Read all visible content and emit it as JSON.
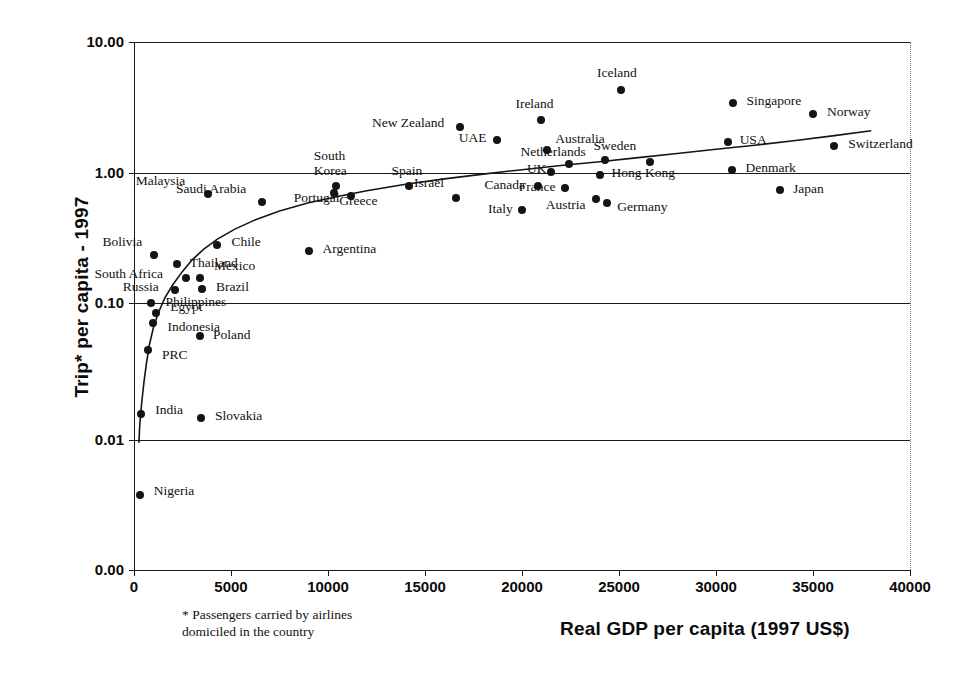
{
  "chart_data": {
    "type": "scatter",
    "title": "",
    "xlabel": "Real GDP per capita (1997 US$)",
    "ylabel": "Trip* per capita - 1997",
    "footnote": "* Passengers carried by airlines\ndomiciled in the country",
    "footnote_line1": "* Passengers carried by airlines",
    "footnote_line2": "domiciled in the country",
    "xlim": [
      0,
      40000
    ],
    "ylim": [
      0.001,
      10.0
    ],
    "yscale": "log",
    "xscale": "linear",
    "grid": true,
    "legend": "none",
    "xticks": [
      "0",
      "5000",
      "10000",
      "15000",
      "20000",
      "25000",
      "30000",
      "35000",
      "40000"
    ],
    "xtick_values": [
      0,
      5000,
      10000,
      15000,
      20000,
      25000,
      30000,
      35000,
      40000
    ],
    "yticks": [
      "10.00",
      "1.00",
      "0.10",
      "0.01",
      "0.00"
    ],
    "ytick_values": [
      10.0,
      1.0,
      0.1,
      0.01,
      0.001
    ],
    "marker_color": "#141414",
    "line_color": "#141414",
    "has_fitted_curve": true,
    "points": [
      {
        "name": "Nigeria",
        "x": 300,
        "y": 0.0038,
        "lx": 14,
        "ly": -4
      },
      {
        "name": "India",
        "x": 380,
        "y": 0.0155,
        "lx": 14,
        "ly": -4
      },
      {
        "name": "PRC",
        "x": 720,
        "y": 0.0455,
        "lx": 14,
        "ly": 5
      },
      {
        "name": "Indonesia",
        "x": 1000,
        "y": 0.072,
        "lx": 14,
        "ly": 4
      },
      {
        "name": "Egypt",
        "x": 1150,
        "y": 0.085,
        "lx": 14,
        "ly": -6
      },
      {
        "name": "Philippines",
        "x": 900,
        "y": 0.1,
        "lx": 14,
        "ly": -1
      },
      {
        "name": "Russia",
        "x": 2100,
        "y": 0.125,
        "lx": -52,
        "ly": -3
      },
      {
        "name": "South Africa",
        "x": 2700,
        "y": 0.155,
        "lx": -92,
        "ly": -4
      },
      {
        "name": "Poland",
        "x": 3400,
        "y": 0.057,
        "lx": 13,
        "ly": -1
      },
      {
        "name": "Slovakia",
        "x": 3450,
        "y": 0.0145,
        "lx": 14,
        "ly": -2
      },
      {
        "name": "Thailand",
        "x": 2200,
        "y": 0.198,
        "lx": 13,
        "ly": -1
      },
      {
        "name": "Bolivia",
        "x": 1050,
        "y": 0.235,
        "lx": -52,
        "ly": -13
      },
      {
        "name": "Mexico",
        "x": 3400,
        "y": 0.157,
        "lx": 14,
        "ly": -12
      },
      {
        "name": "Brazil",
        "x": 3500,
        "y": 0.128,
        "lx": 14,
        "ly": -2
      },
      {
        "name": "Chile",
        "x": 4300,
        "y": 0.28,
        "lx": 14,
        "ly": -3
      },
      {
        "name": "Argentina",
        "x": 9000,
        "y": 0.25,
        "lx": 14,
        "ly": -2
      },
      {
        "name": "Malaysia",
        "x": 3800,
        "y": 0.69,
        "lx": -72,
        "ly": -13
      },
      {
        "name": "Saudi Arabia",
        "x": 6600,
        "y": 0.6,
        "lx": -86,
        "ly": -13
      },
      {
        "name": "Portugal",
        "x": 10300,
        "y": 0.7,
        "lx": -40,
        "ly": 5
      },
      {
        "name": "South Korea",
        "x": 10400,
        "y": 0.8,
        "lx": -22,
        "ly": -31,
        "two_line": true,
        "line1": "South",
        "line2": "Korea"
      },
      {
        "name": "Greece",
        "x": 11200,
        "y": 0.66,
        "lx": -12,
        "ly": 5
      },
      {
        "name": "Spain",
        "x": 14200,
        "y": 0.79,
        "lx": -18,
        "ly": -15
      },
      {
        "name": "Israël",
        "x": 16600,
        "y": 0.64,
        "lx": -42,
        "ly": -15
      },
      {
        "name": "New Zealand",
        "x": 16800,
        "y": 2.25,
        "lx": -88,
        "ly": -4
      },
      {
        "name": "UAE",
        "x": 18700,
        "y": 1.78,
        "lx": -38,
        "ly": -2
      },
      {
        "name": "Italy",
        "x": 20000,
        "y": 0.52,
        "lx": -34,
        "ly": -1
      },
      {
        "name": "Canada",
        "x": 20800,
        "y": 0.79,
        "lx": -53,
        "ly": -1
      },
      {
        "name": "Ireland",
        "x": 21000,
        "y": 2.55,
        "lx": -26,
        "ly": -16
      },
      {
        "name": "Australia",
        "x": 21300,
        "y": 1.51,
        "lx": 8,
        "ly": -11
      },
      {
        "name": "UK",
        "x": 21500,
        "y": 1.02,
        "lx": -24,
        "ly": -3
      },
      {
        "name": "France",
        "x": 22200,
        "y": 0.76,
        "lx": -46,
        "ly": -1
      },
      {
        "name": "Netherlands",
        "x": 22400,
        "y": 1.18,
        "lx": -48,
        "ly": -12
      },
      {
        "name": "Austria",
        "x": 23800,
        "y": 0.63,
        "lx": -50,
        "ly": 6
      },
      {
        "name": "Germany",
        "x": 24400,
        "y": 0.59,
        "lx": 10,
        "ly": 4
      },
      {
        "name": "Hong Kong",
        "x": 24000,
        "y": 0.96,
        "lx": 12,
        "ly": -2
      },
      {
        "name": "Sweden",
        "x": 24300,
        "y": 1.26,
        "lx": -12,
        "ly": -14
      },
      {
        "name": "Iceland",
        "x": 25100,
        "y": 4.3,
        "lx": -24,
        "ly": -17
      },
      {
        "name": "Japan",
        "x": 33300,
        "y": 0.74,
        "lx": 13,
        "ly": -1
      },
      {
        "name": "Denmark",
        "x": 30800,
        "y": 1.06,
        "lx": 14,
        "ly": -2
      },
      {
        "name": "USA",
        "x": 30600,
        "y": 1.73,
        "lx": 12,
        "ly": -2
      },
      {
        "name": "Singapore",
        "x": 30900,
        "y": 3.4,
        "lx": 13,
        "ly": -2
      },
      {
        "name": "Norway",
        "x": 35000,
        "y": 2.8,
        "lx": 14,
        "ly": -2
      },
      {
        "name": "Switzerland",
        "x": 36100,
        "y": 1.6,
        "lx": 14,
        "ly": -2
      },
      {
        "name": "Hong Kong2",
        "x": 26600,
        "y": 1.22,
        "lx": -900,
        "ly": -900,
        "hide_label": true
      }
    ],
    "curve": [
      {
        "x": 250,
        "y": 0.0095
      },
      {
        "x": 300,
        "y": 0.013
      },
      {
        "x": 400,
        "y": 0.019
      },
      {
        "x": 520,
        "y": 0.027
      },
      {
        "x": 650,
        "y": 0.037
      },
      {
        "x": 800,
        "y": 0.05
      },
      {
        "x": 1000,
        "y": 0.066
      },
      {
        "x": 1250,
        "y": 0.085
      },
      {
        "x": 1600,
        "y": 0.11
      },
      {
        "x": 2000,
        "y": 0.138
      },
      {
        "x": 2500,
        "y": 0.175
      },
      {
        "x": 3000,
        "y": 0.215
      },
      {
        "x": 3600,
        "y": 0.26
      },
      {
        "x": 4300,
        "y": 0.31
      },
      {
        "x": 5200,
        "y": 0.37
      },
      {
        "x": 6300,
        "y": 0.44
      },
      {
        "x": 7500,
        "y": 0.51
      },
      {
        "x": 9000,
        "y": 0.59
      },
      {
        "x": 10500,
        "y": 0.66
      },
      {
        "x": 12000,
        "y": 0.73
      },
      {
        "x": 14000,
        "y": 0.82
      },
      {
        "x": 16000,
        "y": 0.9
      },
      {
        "x": 18000,
        "y": 0.98
      },
      {
        "x": 20000,
        "y": 1.06
      },
      {
        "x": 22000,
        "y": 1.14
      },
      {
        "x": 24000,
        "y": 1.22
      },
      {
        "x": 26000,
        "y": 1.31
      },
      {
        "x": 28000,
        "y": 1.41
      },
      {
        "x": 30000,
        "y": 1.52
      },
      {
        "x": 32000,
        "y": 1.63
      },
      {
        "x": 34000,
        "y": 1.76
      },
      {
        "x": 36000,
        "y": 1.92
      },
      {
        "x": 38000,
        "y": 2.1
      }
    ]
  },
  "axes": {
    "y_title": "Trip* per capita - 1997",
    "x_title": "Real GDP per capita (1997 US$)"
  },
  "footnote": {
    "line1": "* Passengers carried by airlines",
    "line2": "domiciled in the country"
  }
}
